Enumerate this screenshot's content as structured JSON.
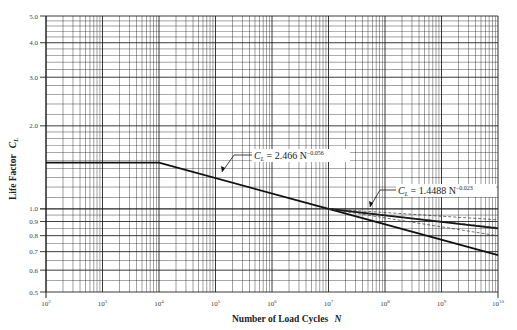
{
  "chart_data": {
    "type": "line",
    "title": "",
    "xlabel": "Number of Load Cycles N",
    "ylabel": "Life Factor C_L",
    "x_scale": "log",
    "y_scale": "log",
    "xlim": [
      100,
      10000000000
    ],
    "ylim": [
      0.5,
      5.0
    ],
    "grid": true,
    "x_ticks": [
      "10^2",
      "10^3",
      "10^4",
      "10^5",
      "10^6",
      "10^7",
      "10^8",
      "10^9",
      "10^10"
    ],
    "y_ticks": [
      "0.5",
      "0.6",
      "0.7",
      "0.8",
      "0.9",
      "1.0",
      "2.0",
      "3.0",
      "4.0",
      "5.0"
    ],
    "series": [
      {
        "name": "C_L = 2.466 N^-0.056",
        "x": [
          100,
          10000,
          10000000,
          10000000000
        ],
        "y": [
          1.47,
          1.47,
          1.0,
          0.68
        ]
      },
      {
        "name": "C_L = 1.4488 N^-0.023",
        "x": [
          10000000,
          10000000000
        ],
        "y": [
          1.0,
          0.85
        ]
      }
    ],
    "annotations": [
      {
        "text": "C_L = 2.466 N^-0.056",
        "points_to": [
          100000,
          1.3
        ]
      },
      {
        "text": "C_L = 1.4488 N^-0.023",
        "points_to": [
          40000000,
          0.97
        ]
      }
    ]
  },
  "labels": {
    "ylabel_main": "Life Factor",
    "ylabel_sym": "C",
    "ylabel_sub": "L",
    "xlabel_main": "Number of Load Cycles",
    "xlabel_sym": "N",
    "eq1_lhs": "C",
    "eq1_sub": "L",
    "eq1_rhs": " = 2.466 N",
    "eq1_exp": "−0.056",
    "eq2_lhs": "C",
    "eq2_sub": "L",
    "eq2_rhs": " = 1.4488 N",
    "eq2_exp": "−0.023"
  },
  "colors": {
    "grid": "#1a1a1a",
    "line": "#111111",
    "background": "#ffffff"
  }
}
